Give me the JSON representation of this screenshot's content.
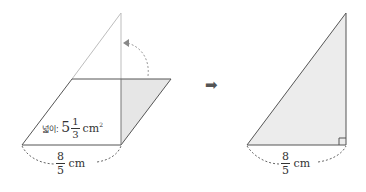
{
  "left_figure": {
    "area_label_prefix": "넓이: ",
    "area_whole": "5",
    "area_num": "1",
    "area_den": "3",
    "area_unit": "cm",
    "area_exp": "2",
    "base_num": "8",
    "base_den": "5",
    "base_unit": "cm"
  },
  "transition_arrow": "➡",
  "right_figure": {
    "base_num": "8",
    "base_den": "5",
    "base_unit": "cm"
  },
  "colors": {
    "line": "#555555",
    "faint_line": "#bbbbbb",
    "shade": "#e6e6e6",
    "arrow": "#555555"
  }
}
